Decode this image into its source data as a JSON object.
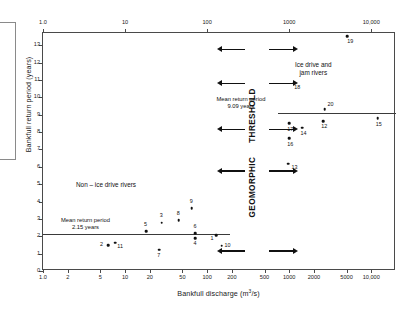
{
  "chart_data": {
    "type": "scatter",
    "title": "",
    "xlabel": "Bankfull discharge (m3/s)",
    "xlabel_base": "Bankfull discharge (m",
    "xlabel_sup": "3",
    "xlabel_tail": "/s)",
    "ylabel": "Bankfull return period (years)",
    "xscale": "log",
    "yscale": "linear",
    "xlim": [
      1.0,
      20000
    ],
    "ylim": [
      0,
      13.7
    ],
    "grid": false,
    "legend": "none",
    "x_ticks_bottom": [
      "1.0",
      "2",
      "5",
      "10",
      "20",
      "50",
      "100",
      "200",
      "500",
      "1000",
      "2000",
      "5000",
      "10,000"
    ],
    "x_tick_values_bottom": [
      1,
      2,
      5,
      10,
      20,
      50,
      100,
      200,
      500,
      1000,
      2000,
      5000,
      10000
    ],
    "x_ticks_top": [
      "1.0",
      "10",
      "100",
      "1000",
      "10,000"
    ],
    "x_tick_values_top": [
      1,
      10,
      100,
      1000,
      10000
    ],
    "y_ticks": [
      "0",
      "1",
      "2",
      "3",
      "4",
      "5",
      "6",
      "7",
      "8",
      "9",
      "10",
      "11",
      "12",
      "13"
    ],
    "y_tick_values": [
      0,
      1,
      2,
      3,
      4,
      5,
      6,
      7,
      8,
      9,
      10,
      11,
      12,
      13
    ],
    "points": [
      {
        "label": "1",
        "x": 130,
        "y": 2.05,
        "lx": -5,
        "ly": 3
      },
      {
        "label": "2",
        "x": 6.2,
        "y": 1.5,
        "lx": -7,
        "ly": 0
      },
      {
        "label": "3",
        "x": 28,
        "y": 2.78,
        "lx": -1,
        "ly": -7
      },
      {
        "label": "4",
        "x": 72,
        "y": 1.9,
        "lx": -1,
        "ly": 6
      },
      {
        "label": "5",
        "x": 18,
        "y": 2.28,
        "lx": -1,
        "ly": -7
      },
      {
        "label": "6",
        "x": 72,
        "y": 2.18,
        "lx": -1,
        "ly": -7
      },
      {
        "label": "7",
        "x": 26,
        "y": 1.22,
        "lx": -1,
        "ly": 6
      },
      {
        "label": "8",
        "x": 45,
        "y": 2.93,
        "lx": -1,
        "ly": -7
      },
      {
        "label": "9",
        "x": 65,
        "y": 3.6,
        "lx": -1,
        "ly": -7
      },
      {
        "label": "10",
        "x": 150,
        "y": 1.45,
        "lx": 4,
        "ly": 0
      },
      {
        "label": "11",
        "x": 7.6,
        "y": 1.62,
        "lx": 3,
        "ly": 4
      },
      {
        "label": "12",
        "x": 2600,
        "y": 8.62,
        "lx": -1,
        "ly": 5
      },
      {
        "label": "13",
        "x": 980,
        "y": 6.18,
        "lx": 4,
        "ly": 4
      },
      {
        "label": "14",
        "x": 1450,
        "y": 8.25,
        "lx": -1,
        "ly": 6
      },
      {
        "label": "15",
        "x": 12000,
        "y": 8.78,
        "lx": -1,
        "ly": 6
      },
      {
        "label": "16",
        "x": 1000,
        "y": 7.65,
        "lx": -1,
        "ly": 6
      },
      {
        "label": "17",
        "x": 1000,
        "y": 8.5,
        "lx": -1,
        "ly": 6
      },
      {
        "label": "18",
        "x": 1150,
        "y": 10.85,
        "lx": 1,
        "ly": 5
      },
      {
        "label": "19",
        "x": 5100,
        "y": 13.5,
        "lx": 1,
        "ly": 5
      },
      {
        "label": "20",
        "x": 2700,
        "y": 9.32,
        "lx": 4,
        "ly": -5
      }
    ],
    "mean_lines": [
      {
        "name": "non-ice-drive-mean",
        "value": 2.15,
        "x_from": 1.0,
        "x_to": 190,
        "caption_line1": "Mean return period",
        "caption_line2": "2.15 years"
      },
      {
        "name": "ice-drive-mean",
        "value": 9.09,
        "x_from": 740,
        "x_to": 20000,
        "caption_line1": "Mean return period",
        "caption_line2": "9.09 years"
      }
    ],
    "annotations": {
      "left_region": "Non – ice drive rivers",
      "right_region_line1": "Ice drive and",
      "right_region_line2": "jam rivers",
      "threshold_word_top": "THRESHOLD",
      "threshold_word_bottom": "GEOMORPHIC"
    },
    "threshold_arrows": {
      "count": 5,
      "y_values": [
        12.8,
        10.85,
        8.2,
        5.8,
        1.2
      ],
      "left_arrow_label": "threshold-arrow-left",
      "right_arrow_label": "threshold-arrow-right"
    }
  },
  "colors": {
    "axis": "#4a4a4a",
    "point": "#111111",
    "text": "#1a1a1a",
    "mean_line": "#3a3a3a",
    "background": "#ffffff"
  }
}
